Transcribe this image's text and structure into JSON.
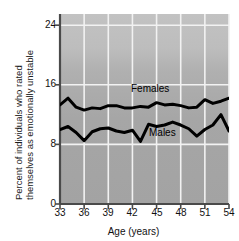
{
  "chart_data": {
    "type": "line",
    "title": "",
    "xlabel": "Age (years)",
    "ylabel_line1": "Percent of individuals who rated",
    "ylabel_line2": "themselves as emotionally unstable",
    "xlim": [
      33,
      54
    ],
    "ylim": [
      0,
      25.5
    ],
    "xticks": [
      "33",
      "36",
      "39",
      "42",
      "45",
      "48",
      "51",
      "54"
    ],
    "xtick_values": [
      33,
      36,
      39,
      42,
      45,
      48,
      51,
      54
    ],
    "yticks": [
      "0",
      "8",
      "16",
      "24"
    ],
    "ytick_values": [
      0,
      8,
      16,
      24
    ],
    "grid": true,
    "grid_color": "#f2f2f2",
    "plot_background": "#a8a8a8",
    "plot_background_top": "#bdbdbd",
    "line_color": "#000000",
    "legend": "inline-annotations",
    "x": [
      33,
      34,
      35,
      36,
      37,
      38,
      39,
      40,
      41,
      42,
      43,
      44,
      45,
      46,
      47,
      48,
      49,
      50,
      51,
      52,
      53,
      54
    ],
    "series": [
      {
        "name": "Females",
        "label": "Females",
        "values": [
          13.3,
          14.2,
          13.0,
          12.6,
          12.9,
          12.8,
          13.2,
          13.2,
          12.9,
          12.9,
          13.1,
          13.0,
          13.6,
          13.3,
          13.4,
          13.2,
          12.9,
          13.0,
          14.0,
          13.5,
          13.8,
          14.2
        ]
      },
      {
        "name": "Males",
        "label": "Males",
        "values": [
          10.0,
          10.4,
          9.6,
          8.5,
          9.7,
          10.1,
          10.2,
          9.8,
          9.6,
          9.9,
          8.4,
          10.7,
          10.4,
          10.6,
          11.0,
          10.6,
          10.1,
          9.1,
          10.0,
          10.6,
          12.0,
          9.8
        ]
      }
    ],
    "annotations": [
      {
        "text": "Females",
        "x": 43.6,
        "y": 16.2
      },
      {
        "text": "Males",
        "x": 44.5,
        "y": 10.6
      }
    ]
  }
}
